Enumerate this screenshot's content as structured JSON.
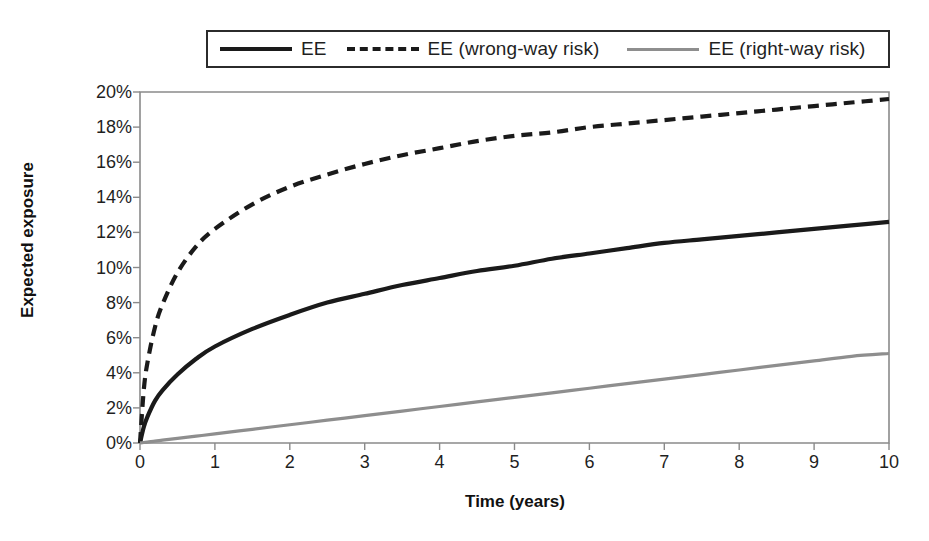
{
  "chart_data": {
    "type": "line",
    "title": "",
    "xlabel": "Time (years)",
    "ylabel": "Expected exposure",
    "xlim": [
      0,
      10
    ],
    "ylim": [
      0,
      0.2
    ],
    "grid": false,
    "legend_position": "top",
    "x_tick_labels": [
      "0",
      "1",
      "2",
      "3",
      "4",
      "5",
      "6",
      "7",
      "8",
      "9",
      "10"
    ],
    "x_ticks": [
      0,
      1,
      2,
      3,
      4,
      5,
      6,
      7,
      8,
      9,
      10
    ],
    "y_tick_labels": [
      "0%",
      "2%",
      "4%",
      "6%",
      "8%",
      "10%",
      "12%",
      "14%",
      "16%",
      "18%",
      "20%"
    ],
    "y_ticks": [
      0,
      2,
      4,
      6,
      8,
      10,
      12,
      14,
      16,
      18,
      20
    ],
    "x": [
      0,
      0.05,
      0.1,
      0.2,
      0.3,
      0.5,
      0.75,
      1,
      1.5,
      2,
      2.5,
      3,
      3.5,
      4,
      4.5,
      5,
      5.5,
      6,
      6.5,
      7,
      7.5,
      8,
      8.5,
      9,
      9.5,
      10
    ],
    "series": [
      {
        "name": "EE",
        "style": "solid",
        "color": "#1a1a1a",
        "values": [
          0.0,
          0.9,
          1.5,
          2.4,
          3.0,
          3.9,
          4.8,
          5.5,
          6.5,
          7.3,
          8.0,
          8.5,
          9.0,
          9.4,
          9.8,
          10.1,
          10.5,
          10.8,
          11.1,
          11.4,
          11.6,
          11.8,
          12.0,
          12.2,
          12.4,
          12.6
        ]
      },
      {
        "name": "EE (wrong-way risk)",
        "style": "dashed",
        "color": "#1a1a1a",
        "values": [
          0.0,
          3.0,
          4.6,
          6.6,
          7.9,
          9.7,
          11.2,
          12.2,
          13.6,
          14.6,
          15.3,
          15.9,
          16.4,
          16.8,
          17.2,
          17.5,
          17.7,
          18.0,
          18.2,
          18.4,
          18.6,
          18.8,
          19.0,
          19.2,
          19.4,
          19.6
        ]
      },
      {
        "name": "EE (right-way risk)",
        "style": "solid",
        "color": "#8e8e8e",
        "values": [
          0.0,
          0.03,
          0.05,
          0.11,
          0.16,
          0.26,
          0.39,
          0.52,
          0.78,
          1.04,
          1.3,
          1.56,
          1.82,
          2.08,
          2.34,
          2.6,
          2.86,
          3.12,
          3.38,
          3.64,
          3.9,
          4.16,
          4.42,
          4.68,
          4.94,
          5.1
        ]
      }
    ]
  },
  "legend": {
    "entries": [
      {
        "label": "EE"
      },
      {
        "label": "EE (wrong-way risk)"
      },
      {
        "label": "EE (right-way risk)"
      }
    ]
  },
  "axes": {
    "x_title": "Time (years)",
    "y_title": "Expected exposure"
  }
}
